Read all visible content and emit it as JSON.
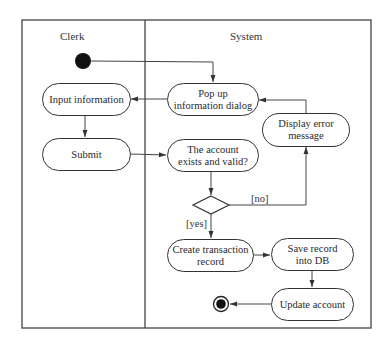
{
  "diagram": {
    "type": "UML activity diagram with swimlanes",
    "lanes": [
      {
        "id": "clerk",
        "label": "Clerk"
      },
      {
        "id": "system",
        "label": "System"
      }
    ],
    "nodes": {
      "start": {
        "kind": "initial"
      },
      "input_information": {
        "label": "Input information",
        "lane": "clerk"
      },
      "submit": {
        "label": "Submit",
        "lane": "clerk"
      },
      "popup_dialog": {
        "label": "Pop up\ninformation dialog",
        "lane": "system"
      },
      "check_account": {
        "label": "The account\nexists and valid?",
        "lane": "system"
      },
      "display_error": {
        "label": "Display error\nmessage",
        "lane": "system"
      },
      "decision": {
        "kind": "decision"
      },
      "create_transaction": {
        "label": "Create transaction\nrecord",
        "lane": "system"
      },
      "save_record": {
        "label": "Save record\ninto DB",
        "lane": "system"
      },
      "update_account": {
        "label": "Update account",
        "lane": "system"
      },
      "end": {
        "kind": "final"
      }
    },
    "guards": {
      "no": "[no]",
      "yes": "[yes]"
    },
    "edges": [
      {
        "from": "start",
        "to": "popup_dialog"
      },
      {
        "from": "popup_dialog",
        "to": "input_information"
      },
      {
        "from": "input_information",
        "to": "submit"
      },
      {
        "from": "submit",
        "to": "check_account"
      },
      {
        "from": "check_account",
        "to": "decision"
      },
      {
        "from": "decision",
        "to": "display_error",
        "guard": "[no]"
      },
      {
        "from": "display_error",
        "to": "popup_dialog"
      },
      {
        "from": "decision",
        "to": "create_transaction",
        "guard": "[yes]"
      },
      {
        "from": "create_transaction",
        "to": "save_record"
      },
      {
        "from": "save_record",
        "to": "update_account"
      },
      {
        "from": "update_account",
        "to": "end"
      }
    ],
    "colors": {
      "line": "#333333",
      "fill": "#ffffff",
      "text": "#222222"
    }
  }
}
